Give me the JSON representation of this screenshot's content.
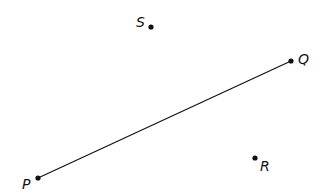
{
  "diagram": {
    "type": "geometry-points",
    "background": "#ffffff",
    "ink_color": "#111111",
    "points": [
      {
        "id": "P",
        "label": "P",
        "x": 38,
        "y": 178,
        "label_x": 22,
        "label_y": 189
      },
      {
        "id": "Q",
        "label": "Q",
        "x": 291,
        "y": 61,
        "label_x": 298,
        "label_y": 64
      },
      {
        "id": "R",
        "label": "R",
        "x": 255,
        "y": 158,
        "label_x": 260,
        "label_y": 171
      },
      {
        "id": "S",
        "label": "S",
        "x": 151,
        "y": 27,
        "label_x": 136,
        "label_y": 27
      }
    ],
    "segments": [
      {
        "from": "P",
        "to": "Q",
        "label": "PQ"
      }
    ]
  }
}
